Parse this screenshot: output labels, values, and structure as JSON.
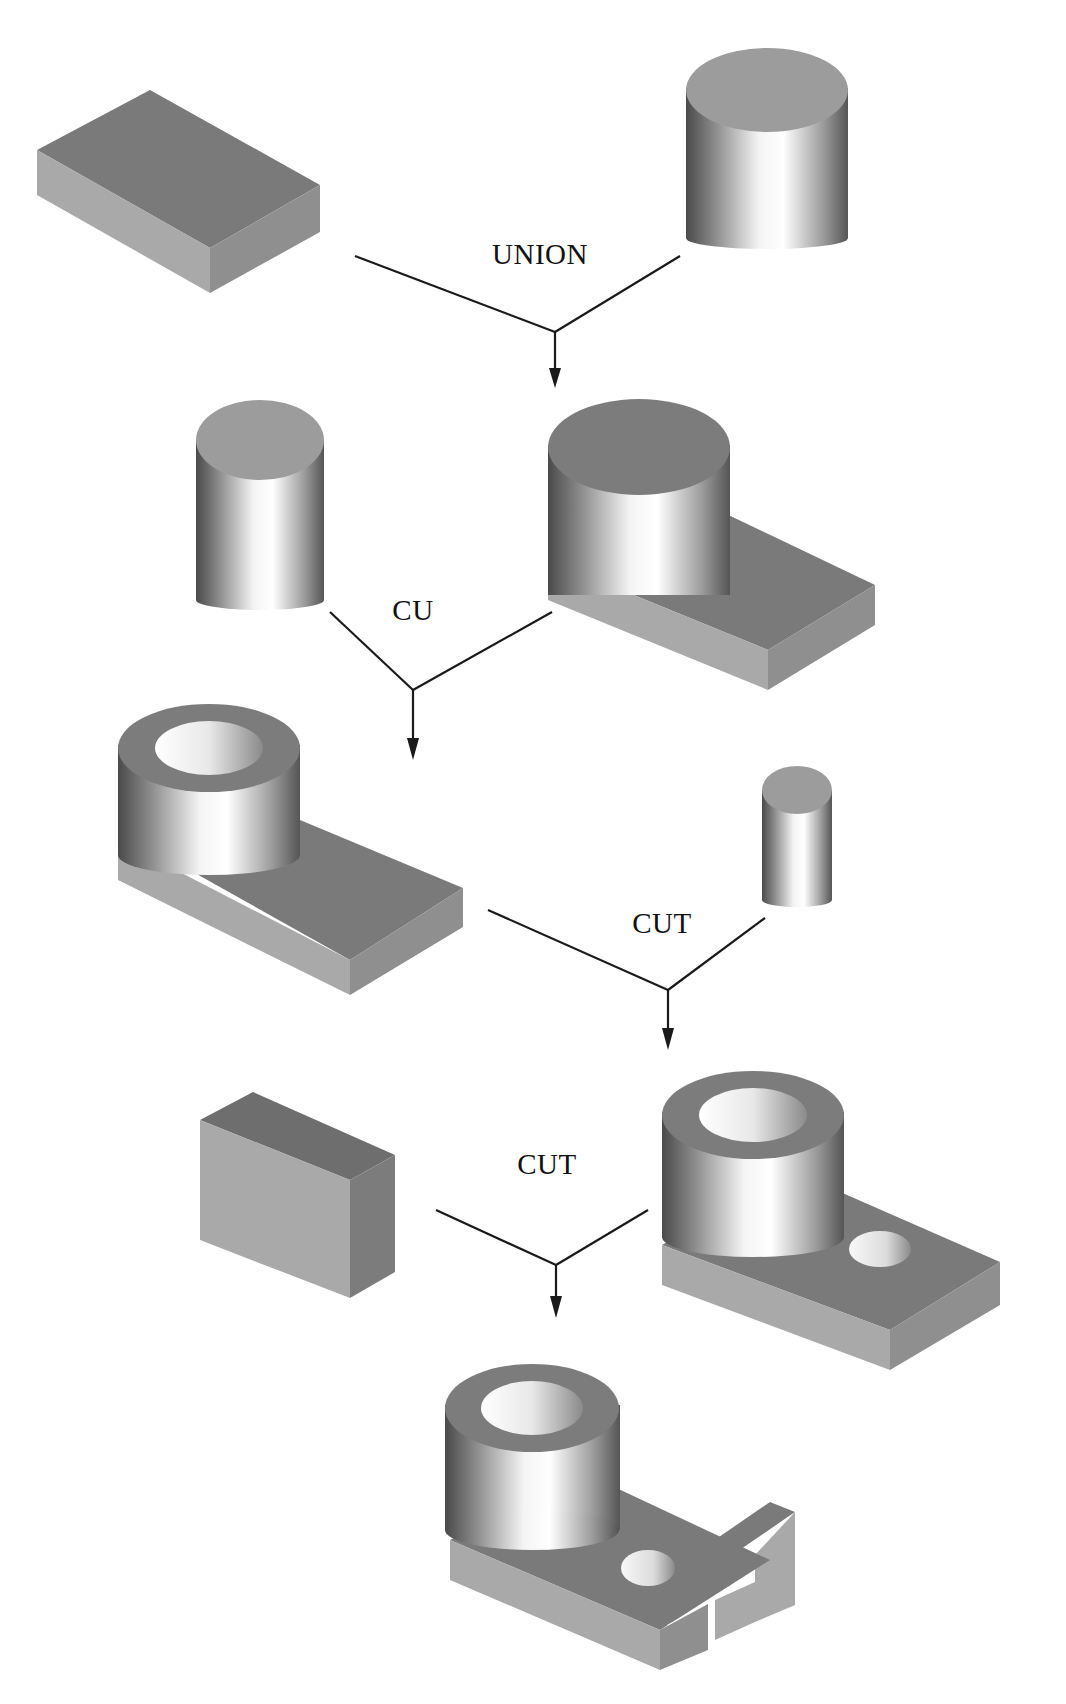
{
  "diagram": {
    "type": "csg-construction-tree",
    "colors": {
      "background": "#ffffff",
      "box_top": "#7a7a7a",
      "box_front_left": "#a8a8a8",
      "box_side_right": "#8e8e8e",
      "cylinder_top": "#9a9a9a",
      "cylinder_body_dark": "#5a5a5a",
      "cylinder_body_light": "#ffffff",
      "line": "#1a1a1a",
      "text": "#111111"
    },
    "operations": [
      {
        "id": "op1",
        "label": "UNION",
        "label_x": 540,
        "label_y": 256
      },
      {
        "id": "op2",
        "label": "CU",
        "label_x": 413,
        "label_y": 612
      },
      {
        "id": "op3",
        "label": "CUT",
        "label_x": 662,
        "label_y": 925
      },
      {
        "id": "op4",
        "label": "CUT",
        "label_x": 547,
        "label_y": 1166
      }
    ],
    "shapes": [
      {
        "id": "block",
        "name": "rectangular block",
        "step": 1
      },
      {
        "id": "cyl_large",
        "name": "large cylinder",
        "step": 1
      },
      {
        "id": "union_result",
        "name": "cylinder unioned with block",
        "step": 2
      },
      {
        "id": "cyl_bore",
        "name": "bore cylinder",
        "step": 2
      },
      {
        "id": "bored_part",
        "name": "part with bore",
        "step": 3
      },
      {
        "id": "cyl_small",
        "name": "small cylinder",
        "step": 3
      },
      {
        "id": "holed_part",
        "name": "part with bore and hole",
        "step": 4
      },
      {
        "id": "slot_block",
        "name": "slot cutter block",
        "step": 4
      },
      {
        "id": "final_part",
        "name": "final slotted part",
        "step": 5
      }
    ]
  }
}
